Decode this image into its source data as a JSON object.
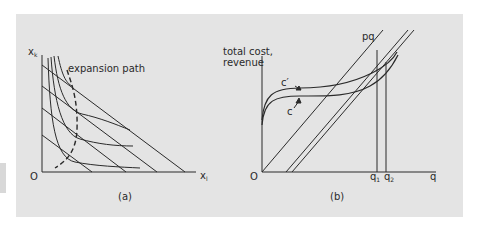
{
  "panel_a": {
    "caption": "(a)",
    "y_axis_label": "x",
    "y_axis_sub": "k",
    "x_axis_label": "x",
    "x_axis_sub": "l",
    "origin_label": "O",
    "annotation": "expansion path"
  },
  "panel_b": {
    "caption": "(b)",
    "y_axis_label_line1": "total cost,",
    "y_axis_label_line2": "revenue",
    "x_axis_label": "q",
    "origin_label": "O",
    "revenue_label": "pq",
    "cost_curve_label": "c",
    "cost_curve2_label": "c′",
    "q1_label": "q",
    "q1_sub": "1",
    "q2_label": "q",
    "q2_sub": "2"
  },
  "colors": {
    "background": "#e4e4e4",
    "line": "#2a2a2a"
  }
}
